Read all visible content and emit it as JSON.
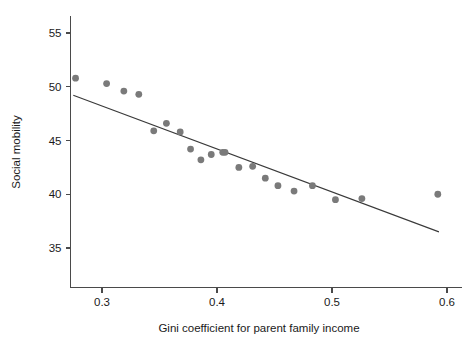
{
  "chart_data": {
    "type": "scatter",
    "title": "",
    "xlabel": "Gini coefficient for parent family income",
    "ylabel": "Social mobility",
    "xlim": [
      0.273,
      0.601
    ],
    "ylim": [
      32.3,
      56.6
    ],
    "xticks": [
      0.3,
      0.4,
      0.5,
      0.6
    ],
    "xticklabels": [
      "0.3",
      "0.4",
      "0.5",
      "0.6"
    ],
    "yticks": [
      35,
      40,
      45,
      50,
      55
    ],
    "yticklabels": [
      "35",
      "40",
      "45",
      "50",
      "55"
    ],
    "grid": false,
    "legend": null,
    "point_color": "#7a7a7a",
    "line_color": "#3a3a3a",
    "axis_color": "#4a4a4a",
    "background": "#ffffff",
    "points": [
      {
        "x": 0.277,
        "y": 50.8
      },
      {
        "x": 0.304,
        "y": 50.3
      },
      {
        "x": 0.319,
        "y": 49.6
      },
      {
        "x": 0.332,
        "y": 49.3
      },
      {
        "x": 0.345,
        "y": 45.9
      },
      {
        "x": 0.356,
        "y": 46.6
      },
      {
        "x": 0.368,
        "y": 45.8
      },
      {
        "x": 0.377,
        "y": 44.2
      },
      {
        "x": 0.386,
        "y": 43.2
      },
      {
        "x": 0.395,
        "y": 43.7
      },
      {
        "x": 0.405,
        "y": 43.9
      },
      {
        "x": 0.407,
        "y": 43.9
      },
      {
        "x": 0.419,
        "y": 42.5
      },
      {
        "x": 0.431,
        "y": 42.6
      },
      {
        "x": 0.442,
        "y": 41.5
      },
      {
        "x": 0.453,
        "y": 40.8
      },
      {
        "x": 0.467,
        "y": 40.3
      },
      {
        "x": 0.483,
        "y": 40.8
      },
      {
        "x": 0.503,
        "y": 39.5
      },
      {
        "x": 0.526,
        "y": 39.6
      },
      {
        "x": 0.592,
        "y": 40.0
      }
    ],
    "fit_line": {
      "type": "linear-regression",
      "x_start": 0.275,
      "y_start": 49.2,
      "x_end": 0.593,
      "y_end": 36.5,
      "slope": -39.9,
      "intercept": 60.2
    }
  }
}
